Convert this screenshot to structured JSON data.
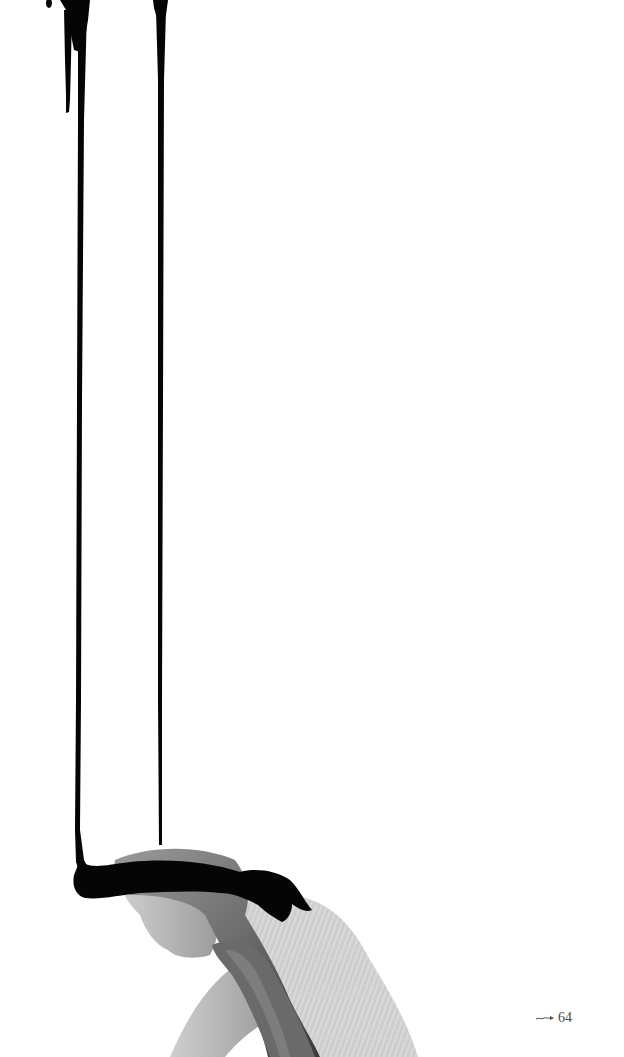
{
  "page": {
    "background": "#ffffff",
    "ink_color": "#050505"
  },
  "illustration": {
    "subject": "black-and-white photo of a bowed woman with long hair and a scarf, black ink dripping from the top of the page onto her head",
    "ink_drips": 2
  },
  "footer": {
    "ornament_icon": "flourish-arrow-icon",
    "page_number": "64"
  }
}
